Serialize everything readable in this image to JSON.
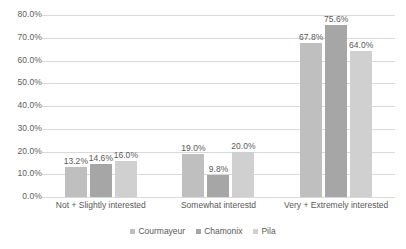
{
  "chart_data": {
    "type": "bar",
    "title": "",
    "subtitle": "",
    "xlabel": "",
    "ylabel": "",
    "ylim": [
      0,
      80
    ],
    "ytick_labels": [
      "0.0%",
      "10.0%",
      "20.0%",
      "30.0%",
      "40.0%",
      "50.0%",
      "60.0%",
      "70.0%",
      "80.0%"
    ],
    "ytick_values": [
      0,
      10,
      20,
      30,
      40,
      50,
      60,
      70,
      80
    ],
    "grid": true,
    "legend_position": "bottom",
    "categories": [
      "Not + Slightly interested",
      "Somewhat interestd",
      "Very + Extremely interested"
    ],
    "series": [
      {
        "name": "Courmayeur",
        "color": "#bfbfbf",
        "values": [
          13.2,
          19.0,
          67.8
        ],
        "labels": [
          "13.2%",
          "19.0%",
          "67.8%"
        ]
      },
      {
        "name": "Chamonix",
        "color": "#a6a6a6",
        "values": [
          14.6,
          9.8,
          75.6
        ],
        "labels": [
          "14.6%",
          "9.8%",
          "75.6%"
        ]
      },
      {
        "name": "Pila",
        "color": "#d0d0d0",
        "values": [
          16.0,
          20.0,
          64.0
        ],
        "labels": [
          "16.0%",
          "20.0%",
          "64.0%"
        ]
      }
    ]
  },
  "colors": {
    "gridline": "#d9d9d9",
    "text": "#595959",
    "background": "#ffffff"
  }
}
